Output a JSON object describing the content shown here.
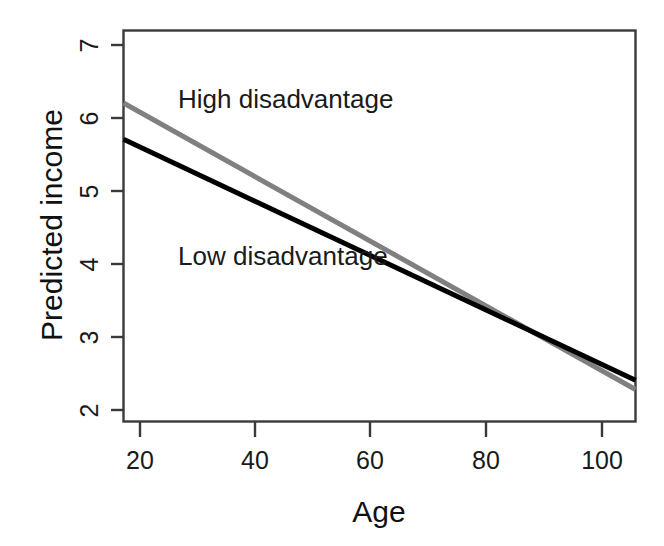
{
  "chart_data": {
    "type": "line",
    "title": "",
    "subtitle": "",
    "xlabel": "Age",
    "ylabel": "Predicted income",
    "xlim": [
      17.2,
      105.8
    ],
    "ylim": [
      1.82,
      7.32
    ],
    "xticks": [
      20,
      40,
      60,
      80,
      100
    ],
    "xtick_labels": [
      "20",
      "40",
      "60",
      "80",
      "100"
    ],
    "yticks": [
      2,
      3,
      4,
      5,
      6,
      7
    ],
    "ytick_labels": [
      "2",
      "3",
      "4",
      "5",
      "6",
      "7"
    ],
    "grid": false,
    "legend_position": "inline-annotations",
    "box": true,
    "series": [
      {
        "name": "High disadvantage",
        "color": "#808080",
        "linewidth": 5,
        "x": [
          17.2,
          105.8
        ],
        "values": [
          6.3,
          2.27
        ]
      },
      {
        "name": "Low disadvantage",
        "color": "#000000",
        "linewidth": 5,
        "x": [
          17.2,
          105.8
        ],
        "values": [
          5.79,
          2.4
        ]
      }
    ],
    "annotations": [
      {
        "text": "High disadvantage",
        "x": 27.5,
        "y": 6.07,
        "series": "High disadvantage"
      },
      {
        "text": "Low disadvantage",
        "x": 27.5,
        "y": 3.92,
        "series": "Low disadvantage"
      }
    ],
    "crossover": {
      "x": 84,
      "y": 3.2
    }
  },
  "axes": {
    "x_title": "Age",
    "y_title": "Predicted income",
    "x_tick_labels": [
      "20",
      "40",
      "60",
      "80",
      "100"
    ],
    "y_tick_labels": [
      "2",
      "3",
      "4",
      "5",
      "6",
      "7"
    ]
  },
  "annotations": {
    "high": "High disadvantage",
    "low": "Low disadvantage"
  },
  "colors": {
    "high_series": "#808080",
    "low_series": "#000000",
    "axis": "#3a3a3a",
    "text": "#1a1a1a",
    "background": "#ffffff"
  }
}
